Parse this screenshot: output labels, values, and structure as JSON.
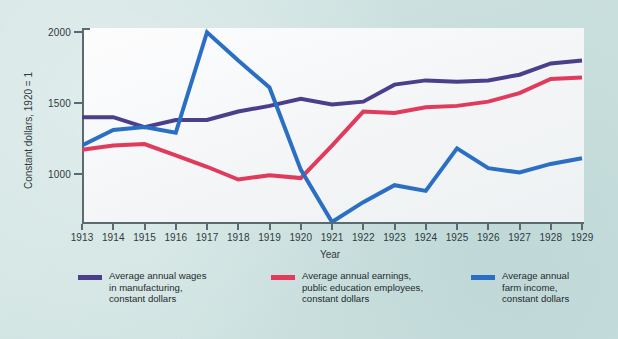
{
  "figure": {
    "background_color": "#cfe3e1",
    "plot_background_color": "#f7f8f9",
    "axis_color": "#5a6a6e"
  },
  "axes": {
    "x_title": "Year",
    "y_title": "Constant dollars, 1920 = 1",
    "y_ticks": [
      "2000",
      "1500",
      "1000"
    ],
    "x_ticks": [
      "1913",
      "1914",
      "1915",
      "1916",
      "1917",
      "1918",
      "1919",
      "1920",
      "1921",
      "1922",
      "1923",
      "1924",
      "1925",
      "1926",
      "1927",
      "1928",
      "1929"
    ]
  },
  "legend": {
    "items": [
      {
        "label": "Average annual wages\nin manufacturing,\nconstant dollars",
        "color": "#4b3f8c"
      },
      {
        "label": "Average annual earnings,\npublic education employees,\nconstant dollars",
        "color": "#e03a5c"
      },
      {
        "label": "Average annual\nfarm income,\nconstant dollars",
        "color": "#2a6fc4"
      }
    ]
  },
  "chart_data": {
    "type": "line",
    "title": "",
    "subtitle": "",
    "xlabel": "Year",
    "ylabel": "Constant dollars, 1920 = 1",
    "grid": false,
    "legend_position": "bottom",
    "x": [
      1913,
      1914,
      1915,
      1916,
      1917,
      1918,
      1919,
      1920,
      1921,
      1922,
      1923,
      1924,
      1925,
      1926,
      1927,
      1928,
      1929
    ],
    "xlim": [
      1913,
      1929
    ],
    "ylim": [
      660,
      2030
    ],
    "yticks": [
      1000,
      1500,
      2000
    ],
    "series": [
      {
        "name": "Average annual wages in manufacturing, constant dollars",
        "color": "#4b3f8c",
        "values": [
          1400,
          1400,
          1330,
          1380,
          1380,
          1440,
          1480,
          1530,
          1490,
          1510,
          1630,
          1660,
          1650,
          1660,
          1700,
          1780,
          1800
        ]
      },
      {
        "name": "Average annual earnings, public education employees, constant dollars",
        "color": "#e03a5c",
        "values": [
          1170,
          1200,
          1210,
          1130,
          1050,
          960,
          990,
          970,
          1200,
          1440,
          1430,
          1470,
          1480,
          1510,
          1570,
          1670,
          1680
        ]
      },
      {
        "name": "Average annual farm income, constant dollars",
        "color": "#2a6fc4",
        "values": [
          1200,
          1310,
          1330,
          1290,
          2000,
          1800,
          1610,
          1030,
          660,
          800,
          920,
          880,
          1180,
          1040,
          1010,
          1070,
          1110
        ]
      }
    ]
  }
}
